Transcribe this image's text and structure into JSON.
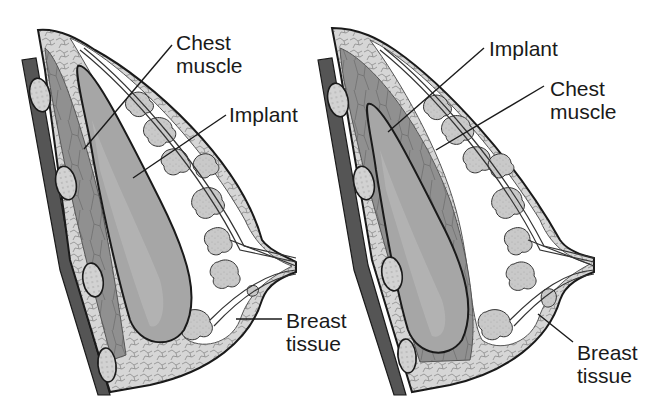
{
  "figure": {
    "type": "anatomical cross-section comparison",
    "palette": {
      "background": "#ffffff",
      "outline": "#1a1a1a",
      "muscle": "#8f8f8f",
      "implant": "#a4a4a4",
      "implant_highlight": "#b8b8b8",
      "fat_tissue": "#d4d4d4",
      "glands": "#c8c8c8",
      "rib": "#cfcfcf",
      "duct_space": "#ffffff"
    },
    "panels": [
      {
        "id": "subglandular",
        "labels": [
          {
            "key": "chest_muscle",
            "lines": [
              "Chest",
              "muscle"
            ]
          },
          {
            "key": "implant",
            "lines": [
              "Implant"
            ]
          },
          {
            "key": "breast_tissue",
            "lines": [
              "Breast",
              "tissue"
            ]
          }
        ]
      },
      {
        "id": "submuscular",
        "labels": [
          {
            "key": "implant",
            "lines": [
              "Implant"
            ]
          },
          {
            "key": "chest_muscle",
            "lines": [
              "Chest",
              "muscle"
            ]
          },
          {
            "key": "breast_tissue",
            "lines": [
              "Breast",
              "tissue"
            ]
          }
        ]
      }
    ]
  },
  "left": {
    "chest_muscle": "Chest\nmuscle",
    "implant": "Implant",
    "breast_tissue": "Breast\ntissue"
  },
  "right": {
    "implant": "Implant",
    "chest_muscle": "Chest\nmuscle",
    "breast_tissue": "Breast\ntissue"
  }
}
